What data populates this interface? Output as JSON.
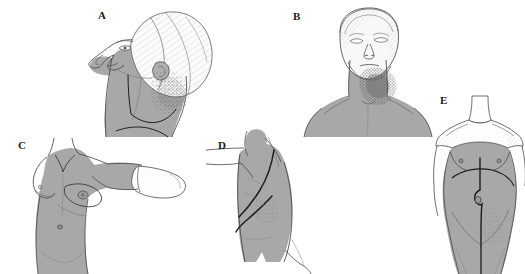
{
  "figure": {
    "type": "medical-illustration-plate",
    "background_color": "#ffffff",
    "width": 525,
    "height": 274
  },
  "palette": {
    "field_shading": "#a8a8a8",
    "field_shading_light": "#b8b8b8",
    "skin_outline": "#4a4a4a",
    "scar_line": "#1c1c1c",
    "hatch_line": "#6e6e6e",
    "stipple_dark": "#5a5a5a",
    "unshaded_skin": "#fdfdfd",
    "label_color": "#1a1a1a"
  },
  "panels": [
    {
      "id": "A",
      "label": "A",
      "label_x": 98,
      "label_y": 10,
      "view": "lateral-head-and-neck",
      "description": "Left lateral view of head with head extended; cranium unshaded with hatching, face lower half, mandible and full neck shaded; vertical and oblique marking lines over the neck; stippled shading over the mastoid / upper cervical region"
    },
    {
      "id": "B",
      "label": "B",
      "label_x": 293,
      "label_y": 11,
      "view": "anterior-neck-head-extended",
      "description": "Frontal view of head tilted backward with chin raised; anterior neck, shoulders and upper chest shaded; dense stippled shading over the right submandibular and upper cervical area"
    },
    {
      "id": "C",
      "label": "C",
      "label_x": 18,
      "label_y": 140,
      "view": "anterior-chest-wall-arm-abducted",
      "description": "Anterior female torso with right arm abducted and extended laterally; chest wall, axilla, upper arm and abdomen shaded; forearm and hand left unshaded; breast and axillary contour lines visible"
    },
    {
      "id": "D",
      "label": "D",
      "label_x": 218,
      "label_y": 140,
      "view": "lateral-chest-wall",
      "description": "Lateral view of thorax with arm raised out of frame; entire lateral chest wall shaded; two bold curved scar lines sweeping obliquely across the shaded field; fine hatching posteriorly"
    },
    {
      "id": "E",
      "label": "E",
      "label_x": 440,
      "label_y": 95,
      "view": "anterior-abdomen-and-pelvis",
      "description": "Anterior female torso; abdomen, pelvis and upper thighs shaded with shoulders and upper chest unshaded; vertical midline incision line curving around the umbilicus and a transverse upper abdominal arc"
    }
  ]
}
